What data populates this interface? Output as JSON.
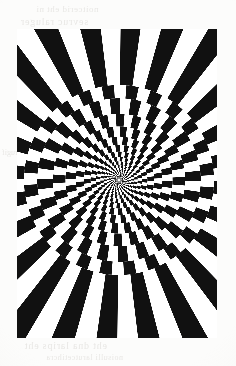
{
  "page": {
    "kind": "scanned-book-page",
    "background_color": "#fcfcfb",
    "width": 236,
    "height": 366
  },
  "bleed_through": {
    "note": "faint mirrored text showing through from reverse side of page",
    "color": "#d8d6d2",
    "lines": [
      {
        "id": "top-1",
        "text": "noitcerid eht ni"
      },
      {
        "id": "top-2",
        "text": "sevruc raluger"
      },
      {
        "id": "left-1",
        "text": "erugif"
      },
      {
        "id": "right-1",
        "text": "nrettap"
      },
      {
        "id": "bot-1",
        "text": "eht dna larips eht"
      },
      {
        "id": "bot-2",
        "text": "noisulli larutcetihcra"
      }
    ]
  },
  "figure": {
    "name": "spiral-checkerboard-illusion",
    "frame": {
      "x": 17,
      "y": 29,
      "width": 200,
      "height": 309
    },
    "ink_color": "#111111",
    "paper_color": "#ffffff"
  },
  "chart_data": {
    "type": "scatter",
    "xlabel": "",
    "ylabel": "",
    "center": {
      "x": 102,
      "y": 151
    },
    "angular_sectors": 48,
    "radial_rings": 26,
    "spiral_twist_per_ring_deg": 3.6,
    "inner_radius_px": 1.2,
    "outer_radius_px": 260,
    "ring_growth_ratio": 1.235,
    "checker_end_radius_px": 95,
    "ray_start_radius_px": 95,
    "colors": [
      "#111111",
      "#ffffff"
    ],
    "grid": false,
    "legend": "none"
  }
}
